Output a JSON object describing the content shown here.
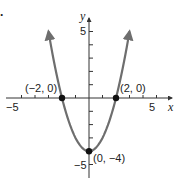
{
  "panel_label": ".",
  "chart_data": {
    "type": "line",
    "title": "",
    "function": "y = x^2 - 4",
    "xlabel": "x",
    "ylabel": "y",
    "xlim": [
      -5,
      5
    ],
    "ylim": [
      -5,
      5
    ],
    "x_tick_labels": [
      "-5",
      "5"
    ],
    "y_tick_labels": [
      "5",
      "-5"
    ],
    "grid": false,
    "series": [
      {
        "name": "parabola",
        "color": "#6e6e6e",
        "x": [
          -3.0,
          -2.5,
          -2,
          -1.5,
          -1,
          -0.5,
          0,
          0.5,
          1,
          1.5,
          2,
          2.5,
          3.0
        ],
        "y": [
          5.0,
          2.25,
          0,
          -1.75,
          -3,
          -3.75,
          -4,
          -3.75,
          -3,
          -1.75,
          0,
          2.25,
          5.0
        ]
      }
    ],
    "marked_points": [
      {
        "x": -2,
        "y": 0,
        "label": "(−2, 0)"
      },
      {
        "x": 2,
        "y": 0,
        "label": "(2, 0)"
      },
      {
        "x": 0,
        "y": -4,
        "label": "(0, −4)"
      }
    ]
  },
  "labels": {
    "x_axis": "x",
    "y_axis": "y",
    "x_neg5": "−5",
    "x_pos5": "5",
    "y_pos5": "5",
    "y_neg5": "−5",
    "pt_left": "(−2, 0)",
    "pt_right": "(2, 0)",
    "pt_vertex": "(0, −4)"
  }
}
